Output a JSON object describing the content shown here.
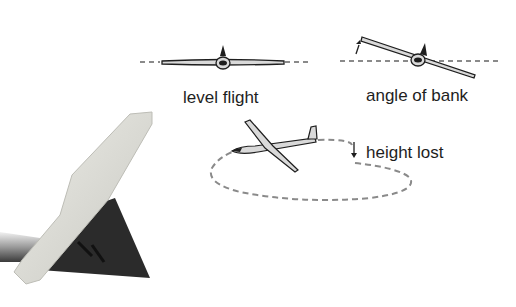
{
  "diagram": {
    "panels": [
      {
        "id": "level",
        "label": "level flight"
      },
      {
        "id": "bank",
        "label": "angle of bank"
      },
      {
        "id": "turn",
        "label": "height lost"
      }
    ],
    "photo": {
      "subject": "model aircraft tail fin and rudder"
    },
    "colors": {
      "line": "#1e1e1e",
      "dash": "#8a8a8a",
      "wing_fill": "#d9d9d9",
      "fin_dark": "#2b2b2b",
      "fin_light": "#d8d8d2"
    }
  }
}
